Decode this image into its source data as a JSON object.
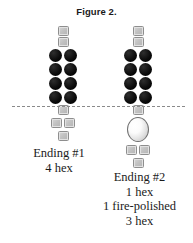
{
  "figure": {
    "title": "Figure 2.",
    "background_color": "#ffffff",
    "dashed_line_color": "#8a8a8a"
  },
  "legend_colors": {
    "hex_bead": "#c2c2c2",
    "hex_bead_border": "#8e8e8e",
    "round_bead": "#0a0a0a",
    "fire_polished_bead": "#ffffff",
    "fire_polished_border": "#6f6f6f",
    "text": "#1b1b1b"
  },
  "columns": [
    {
      "id": "ending-1",
      "above_line": {
        "hex_rows": [
          1,
          1
        ],
        "round_rows": [
          2,
          2,
          2,
          2
        ]
      },
      "below_line": {
        "hex_rows": [
          1,
          2,
          1
        ],
        "fire_polished": 0
      },
      "label": {
        "lines": [
          "Ending #1",
          "4 hex"
        ]
      }
    },
    {
      "id": "ending-2",
      "above_line": {
        "hex_rows": [
          1,
          1
        ],
        "round_rows": [
          2,
          2,
          2,
          2
        ]
      },
      "below_line": {
        "hex_rows": [
          1,
          2,
          1
        ],
        "fire_polished": 1
      },
      "label": {
        "lines": [
          "Ending #2",
          "1 hex",
          "1 fire-polished",
          "3 hex"
        ]
      }
    }
  ]
}
